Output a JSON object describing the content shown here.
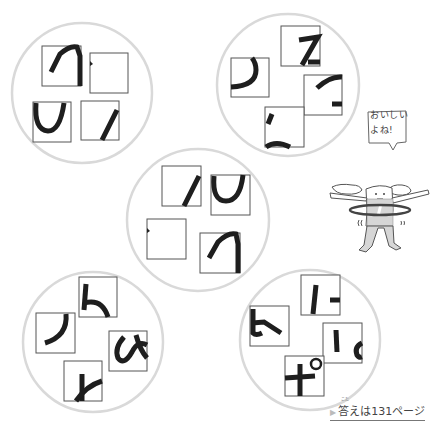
{
  "puzzle": {
    "circles": [
      {
        "id": 1,
        "cx": 82,
        "cy": 93,
        "r": 70,
        "pieces": 4
      },
      {
        "id": 2,
        "cx": 288,
        "cy": 85,
        "r": 71,
        "pieces": 4
      },
      {
        "id": 3,
        "cx": 198,
        "cy": 220,
        "r": 71,
        "pieces": 4
      },
      {
        "id": 4,
        "cx": 93,
        "cy": 342,
        "r": 70,
        "pieces": 4
      },
      {
        "id": 5,
        "cx": 310,
        "cy": 340,
        "r": 70,
        "pieces": 4
      }
    ]
  },
  "character": {
    "speech_line1": "おいしい",
    "speech_line2": "よね!"
  },
  "answer": {
    "ruby": "こた",
    "label": "答えは131ページ",
    "marker": "▶"
  },
  "colors": {
    "circle_stroke": "#d9d9d9",
    "ink": "#1e1e1e",
    "body_fill": "#d6d6d6"
  }
}
